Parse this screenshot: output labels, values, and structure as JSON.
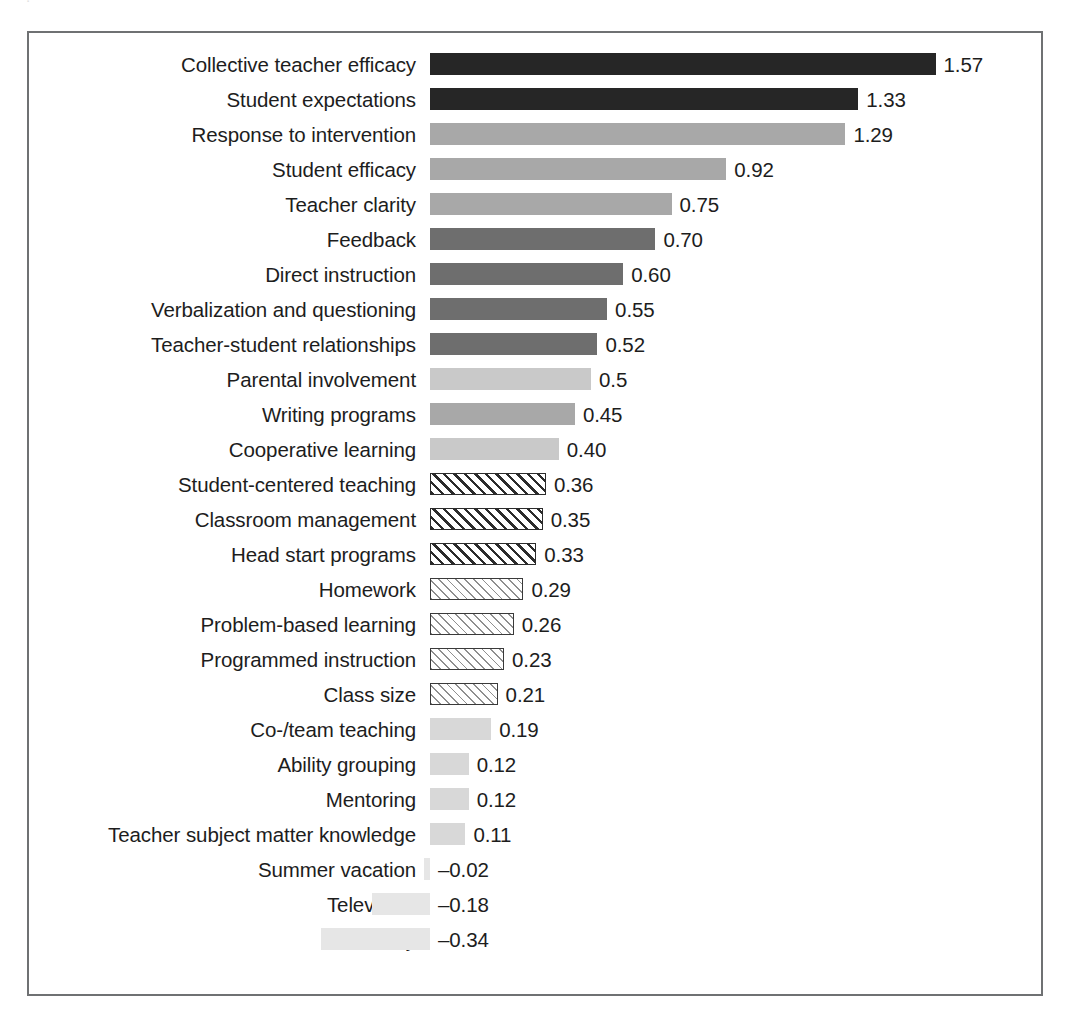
{
  "figure": {
    "caption_remnant": "visible cropped caption line above frame",
    "frame_color": "#6f7173",
    "background": "#ffffff"
  },
  "chart_data": {
    "type": "bar",
    "orientation": "horizontal",
    "title": "",
    "subtitle": "",
    "xlabel": "",
    "ylabel": "",
    "xlim": [
      -0.34,
      1.57
    ],
    "zero_baseline": 0,
    "grid": false,
    "legend": false,
    "axis_ticks_visible": false,
    "value_label_format": "two decimals (0.5 shown with one)",
    "categories": [
      "Collective teacher efficacy",
      "Student expectations",
      "Response to intervention",
      "Student efficacy",
      "Teacher clarity",
      "Feedback",
      "Direct instruction",
      "Verbalization and questioning",
      "Teacher-student relationships",
      "Parental involvement",
      "Writing programs",
      "Cooperative learning",
      "Student-centered teaching",
      "Classroom management",
      "Head start programs",
      "Homework",
      "Problem-based learning",
      "Programmed instruction",
      "Class size",
      "Co-/team teaching",
      "Ability grouping",
      "Mentoring",
      "Teacher subject matter knowledge",
      "Summer vacation",
      "Television",
      "Mobility"
    ],
    "values": [
      1.57,
      1.33,
      1.29,
      0.92,
      0.75,
      0.7,
      0.6,
      0.55,
      0.52,
      0.5,
      0.45,
      0.4,
      0.36,
      0.35,
      0.33,
      0.29,
      0.26,
      0.23,
      0.21,
      0.19,
      0.12,
      0.12,
      0.11,
      -0.02,
      -0.18,
      -0.34
    ],
    "value_labels": [
      "1.57",
      "1.33",
      "1.29",
      "0.92",
      "0.75",
      "0.70",
      "0.60",
      "0.55",
      "0.52",
      "0.5",
      "0.45",
      "0.40",
      "0.36",
      "0.35",
      "0.33",
      "0.29",
      "0.26",
      "0.23",
      "0.21",
      "0.19",
      "0.12",
      "0.12",
      "0.11",
      "–0.02",
      "–0.18",
      "–0.34"
    ],
    "fills": [
      "black",
      "black",
      "gray",
      "gray",
      "gray",
      "dark",
      "dark",
      "dark",
      "dark",
      "light",
      "gray",
      "light",
      "hatch-dense",
      "hatch-dense",
      "hatch-dense",
      "hatch-fine",
      "hatch-fine",
      "hatch-fine",
      "hatch-fine",
      "pale",
      "pale",
      "pale",
      "pale",
      "vpale",
      "vpale",
      "vpale"
    ],
    "fill_colors": {
      "black": "#262626",
      "gray": "#a8a8a8",
      "dark": "#6e6e6e",
      "light": "#c9c9c9",
      "pale": "#d8d8d8",
      "vpale": "#e6e6e6",
      "hatch-dense": "diagonal-hatch-dense",
      "hatch-fine": "diagonal-hatch-fine"
    }
  }
}
